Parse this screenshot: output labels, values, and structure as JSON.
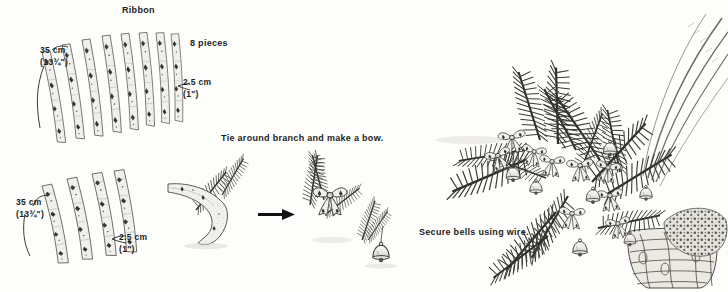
{
  "figure": {
    "background_color": "#fdfdfc",
    "ink_color": "#1d1d1d",
    "width": 728,
    "height": 292
  },
  "labels": {
    "ribbon": "Ribbon",
    "pieces": "8 pieces",
    "length_top_metric": "35 cm",
    "length_top_imperial": "(13¾\")",
    "width_top_metric": "2.5 cm",
    "width_top_imperial": "(1\")",
    "length_bottom_metric": "35 cm",
    "length_bottom_imperial": "(13¾\")",
    "width_bottom_metric": "2.5 cm",
    "width_bottom_imperial": "(1\")",
    "step_tie": "Tie around branch and make a bow.",
    "step_bells": "Secure bells using wire."
  },
  "panels": [
    {
      "name": "ribbon-cutting-top",
      "caption": "Ribbon",
      "quantity": "8 pieces",
      "strip_count": 8,
      "dimensions": {
        "length": "35 cm (13¾\")",
        "width": "2.5 cm (1\")"
      }
    },
    {
      "name": "ribbon-cutting-bottom",
      "strip_count": 4,
      "dimensions": {
        "length": "35 cm (13¾\")",
        "width": "2.5 cm (1\")"
      }
    },
    {
      "name": "tie-bow-step",
      "caption": "Tie around branch and make a bow.",
      "has_arrow": true
    },
    {
      "name": "bell-step",
      "caption": "Secure bells using wire."
    },
    {
      "name": "finished-arrangement",
      "caption": ""
    }
  ],
  "icons": {
    "arrow": "arrow-right-icon",
    "bell": "bell-icon",
    "bow": "bow-icon",
    "branch": "pine-branch-icon",
    "ribbon_strip": "ribbon-strip-icon",
    "basket": "basket-icon"
  }
}
